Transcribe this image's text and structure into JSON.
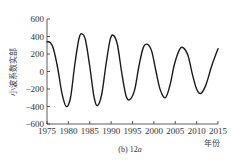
{
  "chart_data": {
    "type": "line",
    "title": "",
    "caption": "(b) 12a",
    "caption_prefix": "(b) 12",
    "caption_italic": "a",
    "xlabel": "年份",
    "ylabel": "小波系数实部",
    "xlim": [
      1975,
      2015
    ],
    "ylim": [
      -600,
      600
    ],
    "xticks": [
      1975,
      1980,
      1985,
      1990,
      1995,
      2000,
      2005,
      2010,
      2015
    ],
    "yticks": [
      600,
      400,
      200,
      0,
      -200,
      -400,
      -600
    ],
    "ytick_labels": [
      "600",
      "400",
      "200",
      "0",
      "−200",
      "−400",
      "−600"
    ],
    "grid": false,
    "legend": null,
    "series": [
      {
        "name": "12a wavelet real part",
        "color": "#1a1a1a",
        "points": [
          [
            1975.0,
            340
          ],
          [
            1975.8,
            330
          ],
          [
            1976.5,
            260
          ],
          [
            1977.5,
            40
          ],
          [
            1978.5,
            -250
          ],
          [
            1979.5,
            -400
          ],
          [
            1980.5,
            -300
          ],
          [
            1981.5,
            80
          ],
          [
            1982.5,
            380
          ],
          [
            1983.2,
            430
          ],
          [
            1984.0,
            360
          ],
          [
            1985.0,
            60
          ],
          [
            1986.0,
            -290
          ],
          [
            1986.8,
            -390
          ],
          [
            1987.8,
            -260
          ],
          [
            1988.8,
            80
          ],
          [
            1989.8,
            370
          ],
          [
            1990.6,
            410
          ],
          [
            1991.5,
            300
          ],
          [
            1992.5,
            -20
          ],
          [
            1993.5,
            -280
          ],
          [
            1994.4,
            -320
          ],
          [
            1995.5,
            -210
          ],
          [
            1996.5,
            60
          ],
          [
            1997.5,
            270
          ],
          [
            1998.5,
            310
          ],
          [
            1999.5,
            230
          ],
          [
            2000.5,
            0
          ],
          [
            2001.5,
            -210
          ],
          [
            2002.7,
            -300
          ],
          [
            2003.8,
            -150
          ],
          [
            2004.8,
            80
          ],
          [
            2006.0,
            250
          ],
          [
            2006.9,
            270
          ],
          [
            2008.0,
            180
          ],
          [
            2009.0,
            -30
          ],
          [
            2010.0,
            -200
          ],
          [
            2011.0,
            -250
          ],
          [
            2012.2,
            -150
          ],
          [
            2013.5,
            60
          ],
          [
            2015.0,
            260
          ]
        ]
      }
    ]
  }
}
